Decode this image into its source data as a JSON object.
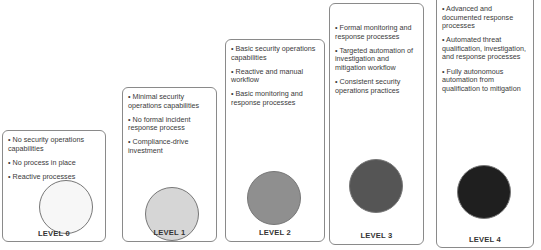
{
  "levels": [
    {
      "label": "LEVEL 0",
      "fill": "#f7f7f7",
      "bullets": [
        "• No security operations capabilities",
        "• No process in place",
        "• Reactive processes"
      ]
    },
    {
      "label": "LEVEL 1",
      "fill": "#d6d6d6",
      "bullets": [
        "• Minimal security operations capabilities",
        "• No formal incident response process",
        "• Compliance-drive investment"
      ]
    },
    {
      "label": "LEVEL 2",
      "fill": "#8f8f8f",
      "bullets": [
        "• Basic security operations capabilities",
        "• Reactive and manual workflow",
        "• Basic monitoring and response processes"
      ]
    },
    {
      "label": "LEVEL 3",
      "fill": "#555555",
      "bullets": [
        "• Formal monitoring and response processes",
        "• Targeted automation of investigation and mitigation workflow",
        "• Consistent security operations practices"
      ]
    },
    {
      "label": "LEVEL 4",
      "fill": "#1f1f1f",
      "bullets": [
        "• Advanced and documented response processes",
        "• Automated threat qualification, investigation, and response processes",
        "• Fully autonomous automation from qualification to mitigation"
      ]
    }
  ]
}
